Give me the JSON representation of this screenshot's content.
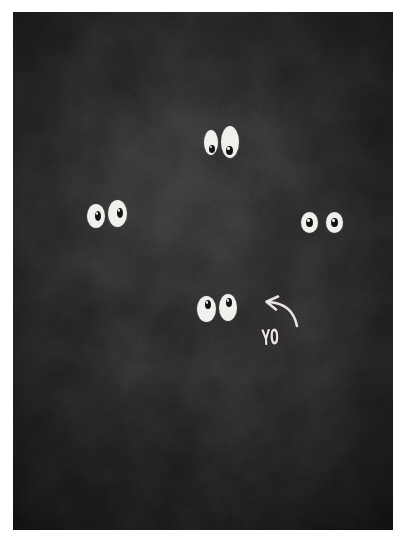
{
  "image": {
    "title": "Cartoon eyes in the dark with YO caption",
    "background_color": "#1d1b1c",
    "page_color": "#ffffff",
    "eye_white_color": "#f2f0ec",
    "pupil_color": "#141213",
    "ink_color": "#e9e6e1"
  },
  "caption": {
    "text": "YO"
  },
  "annotation": {
    "arrow_name": "curved-arrow-up-left"
  },
  "eye_pairs": [
    {
      "name": "eye-pair-top",
      "left": 186,
      "top": 106,
      "eyes": [
        {
          "x": 5,
          "y": 12,
          "w": 14,
          "h": 25,
          "pupil_x": 5,
          "pupil_y": 15,
          "pupil_w": 6,
          "pupil_h": 8
        },
        {
          "x": 22,
          "y": 8,
          "w": 18,
          "h": 32,
          "pupil_x": 5,
          "pupil_y": 20,
          "pupil_w": 7,
          "pupil_h": 9
        }
      ]
    },
    {
      "name": "eye-pair-left",
      "left": 72,
      "top": 186,
      "eyes": [
        {
          "x": 2,
          "y": 6,
          "w": 18,
          "h": 24,
          "pupil_x": 8,
          "pupil_y": 7,
          "pupil_w": 6,
          "pupil_h": 10
        },
        {
          "x": 23,
          "y": 2,
          "w": 19,
          "h": 27,
          "pupil_x": 9,
          "pupil_y": 8,
          "pupil_w": 6,
          "pupil_h": 10
        }
      ]
    },
    {
      "name": "eye-pair-right",
      "left": 288,
      "top": 196,
      "eyes": [
        {
          "x": 0,
          "y": 4,
          "w": 17,
          "h": 21,
          "pupil_x": 5,
          "pupil_y": 6,
          "pupil_w": 7,
          "pupil_h": 9
        },
        {
          "x": 25,
          "y": 4,
          "w": 17,
          "h": 21,
          "pupil_x": 5,
          "pupil_y": 6,
          "pupil_w": 7,
          "pupil_h": 9
        }
      ]
    },
    {
      "name": "eye-pair-bottom",
      "left": 182,
      "top": 280,
      "eyes": [
        {
          "x": 2,
          "y": 4,
          "w": 19,
          "h": 26,
          "pupil_x": 8,
          "pupil_y": 4,
          "pupil_w": 6,
          "pupil_h": 9
        },
        {
          "x": 24,
          "y": 2,
          "w": 18,
          "h": 27,
          "pupil_x": 7,
          "pupil_y": 4,
          "pupil_w": 6,
          "pupil_h": 9
        }
      ]
    }
  ]
}
